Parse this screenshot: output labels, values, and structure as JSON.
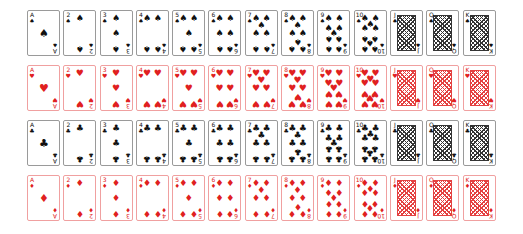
{
  "ranks": [
    "A",
    "2",
    "3",
    "4",
    "5",
    "6",
    "7",
    "8",
    "9",
    "10",
    "J",
    "Q",
    "K"
  ],
  "suits": [
    {
      "name": "spades",
      "symbol": "♠",
      "color": "black",
      "top": 10
    },
    {
      "name": "hearts",
      "symbol": "♥",
      "color": "red",
      "top": 65
    },
    {
      "name": "clubs",
      "symbol": "♣",
      "color": "black",
      "top": 120
    },
    {
      "name": "diamonds",
      "symbol": "♦",
      "color": "red",
      "top": 175
    }
  ],
  "colors": {
    "black": "#111111",
    "red": "#e02020",
    "black_border": "#9a9a9a",
    "red_border": "#f0a0a0"
  }
}
